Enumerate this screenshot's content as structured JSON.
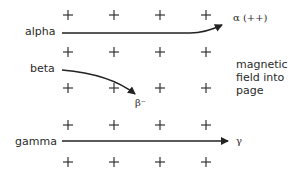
{
  "diagram": {
    "type": "radiation deflection in magnetic field",
    "inputs": [
      {
        "name": "alpha",
        "label": "alpha",
        "output_label": "α (++)",
        "deflection": "up"
      },
      {
        "name": "beta",
        "label": "beta",
        "output_label": "β⁻",
        "deflection": "down"
      },
      {
        "name": "gamma",
        "label": "gamma",
        "output_label": "γ",
        "deflection": "none"
      }
    ],
    "field_note": [
      "magnetic",
      "field into",
      "page"
    ],
    "field_symbol": "+",
    "grid": {
      "rows": 5,
      "cols": 4
    }
  }
}
